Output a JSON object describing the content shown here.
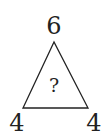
{
  "puzzle": {
    "top_value": "6",
    "bottom_left_value": "4",
    "bottom_right_value": "4",
    "center_value": "?"
  },
  "shape": {
    "type": "triangle",
    "stroke_color": "#222222"
  }
}
